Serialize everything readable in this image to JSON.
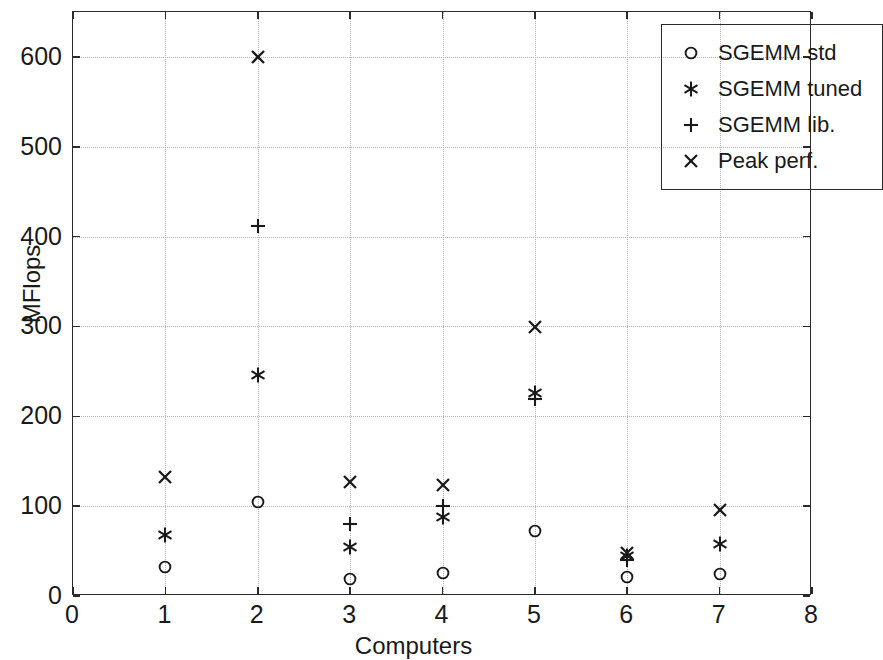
{
  "chart_data": {
    "type": "scatter",
    "title": "",
    "xlabel": "Computers",
    "ylabel": "MFlops",
    "xlim": [
      0,
      8
    ],
    "ylim": [
      0,
      650
    ],
    "xticks": [
      0,
      1,
      2,
      3,
      4,
      5,
      6,
      7,
      8
    ],
    "xtick_labels": [
      "0",
      "1",
      "2",
      "3",
      "4",
      "5",
      "6",
      "7",
      "8"
    ],
    "yticks": [
      0,
      100,
      200,
      300,
      400,
      500,
      600
    ],
    "ytick_labels": [
      "0",
      "100",
      "200",
      "300",
      "400",
      "500",
      "600"
    ],
    "grid": true,
    "grid_style": "dotted",
    "legend_position": "top-right",
    "x": [
      1,
      2,
      3,
      4,
      5,
      6,
      7
    ],
    "series": [
      {
        "name": "SGEMM std",
        "marker": "circle",
        "values": [
          32,
          105,
          19,
          26,
          72,
          21,
          25
        ]
      },
      {
        "name": "SGEMM tuned",
        "marker": "asterisk",
        "values": [
          68,
          246,
          54,
          88,
          226,
          44,
          58
        ]
      },
      {
        "name": "SGEMM lib.",
        "marker": "plus",
        "values": [
          null,
          412,
          80,
          100,
          219,
          40,
          null
        ]
      },
      {
        "name": "Peak perf.",
        "marker": "x",
        "values": [
          133,
          600,
          127,
          123,
          299,
          48,
          96
        ]
      }
    ]
  },
  "axes": {
    "y_title": "MFlops",
    "x_title": "Computers"
  },
  "legend": {
    "entries": [
      {
        "marker": "circle",
        "label": "SGEMM std"
      },
      {
        "marker": "asterisk",
        "label": "SGEMM tuned"
      },
      {
        "marker": "plus",
        "label": "SGEMM lib."
      },
      {
        "marker": "x",
        "label": "Peak perf."
      }
    ]
  },
  "colors": {
    "axis": "#2a2a2a",
    "grid": "#b4b4b4",
    "marker": "#1a1a1a",
    "background": "#ffffff"
  }
}
